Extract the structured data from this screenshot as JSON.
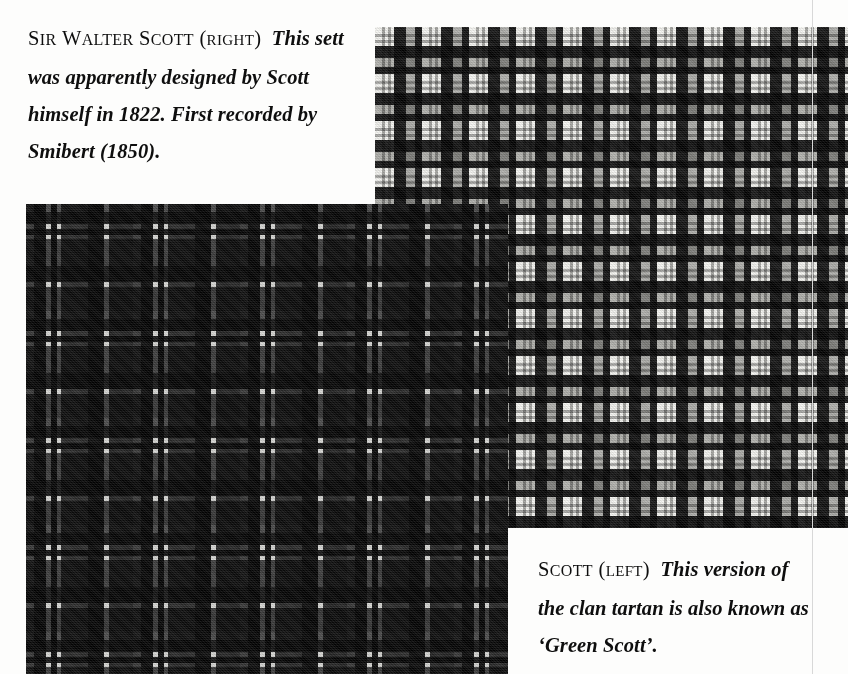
{
  "page": {
    "width": 848,
    "height": 674,
    "background_color": "#fdfdfc",
    "gutter_rule_color": "#d8d8d8"
  },
  "captions": {
    "top": {
      "lead_word_1": "S",
      "lead_word_1_rest": "IR",
      "lead_word_2": "W",
      "lead_word_2_rest": "ALTER",
      "lead_word_3": "S",
      "lead_word_3_rest": "COTT",
      "side_open": "(",
      "side_word": "RIGHT",
      "side_close": ")",
      "body": "This sett was apparently designed by Scott himself in 1822. First recorded by Smibert (1850).",
      "full_text": "SIR WALTER SCOTT (RIGHT) This sett was apparently designed by Scott himself in 1822. First recorded by Smibert (1850)."
    },
    "bottom": {
      "lead_word_1": "S",
      "lead_word_1_rest": "COTT",
      "side_open": "(",
      "side_word": "LEFT",
      "side_close": ")",
      "body": "This version of the clan tartan is also known as ‘Green Scott’.",
      "full_text": "SCOTT (LEFT) This version of the clan tartan is also known as ‘Green Scott’."
    }
  },
  "plates": {
    "right": {
      "name": "Sir Walter Scott tartan swatch",
      "position": "right",
      "tone": "light",
      "x": 375,
      "y": 27,
      "width": 473,
      "height": 501,
      "sett_repeat_px": 47,
      "palette": [
        "#fafaf8",
        "#a8a8a5",
        "#969694",
        "#0f0f0f"
      ]
    },
    "left": {
      "name": "Scott / Green Scott clan tartan swatch",
      "position": "left",
      "tone": "dark",
      "x": 26,
      "y": 204,
      "width": 482,
      "height": 470,
      "sett_repeat_px": 107,
      "palette": [
        "#ecece a",
        "#4a4a4a",
        "#2e2e2e",
        "#0c0c0c"
      ]
    }
  }
}
